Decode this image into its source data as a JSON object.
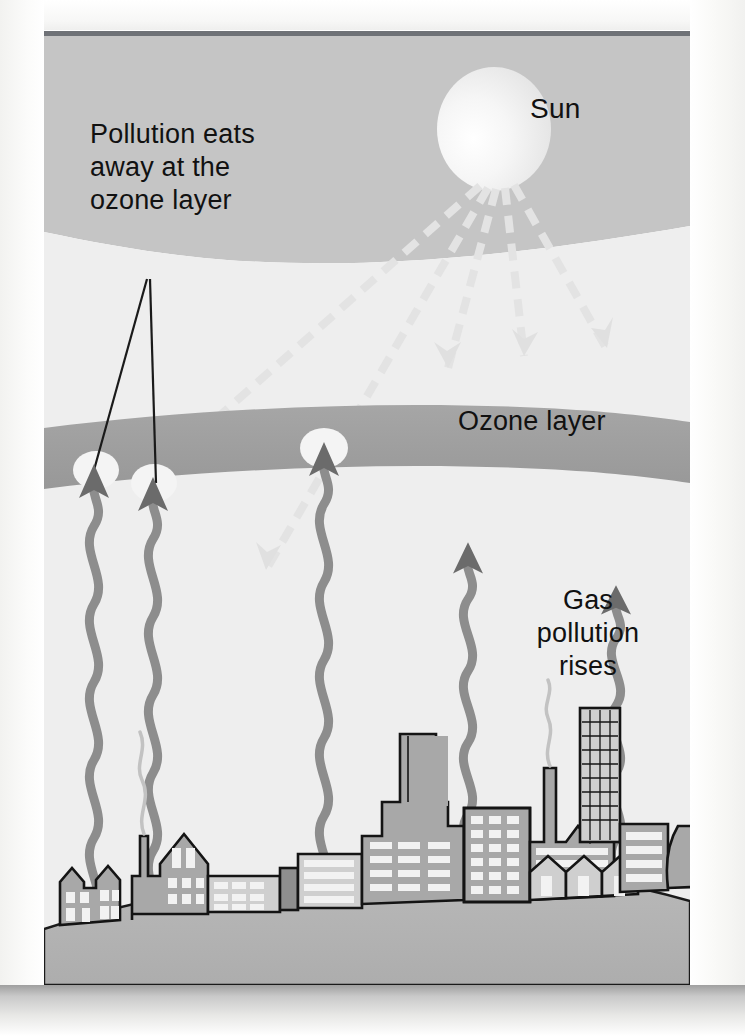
{
  "figure": {
    "kind": "ozone-depletion-diagram",
    "labels": {
      "pollution_note": "Pollution eats\nawayatthe\nozone layer",
      "pollution_line1": "Pollution eats",
      "pollution_line2": "away at the",
      "pollution_line3": "ozone layer",
      "sun": "Sun",
      "ozone_layer": "Ozone layer",
      "gas_line1": "Gas",
      "gas_line2": "pollution",
      "gas_line3": "rises"
    },
    "palette": {
      "sky_upper": "#c5c5c5",
      "sky_lower": "#eeeeee",
      "ozone_band": "#a0a0a0",
      "ground": "#b4b4b4",
      "building_fill": "#a8a8a8",
      "building_fill_light": "#cfcfcf",
      "window": "#f2f2f2",
      "outline": "#141414",
      "smoke_arrow": "#8d8d8d",
      "sun_ray": "#e2e2e2",
      "sun_body": "#f3f3f3",
      "page_rule": "#6f7277",
      "text": "#111111"
    },
    "elements": {
      "sun_rays_count": 6,
      "pollution_plumes_count": 5,
      "ozone_holes_count": 3,
      "pointer_lines_count": 2
    }
  }
}
